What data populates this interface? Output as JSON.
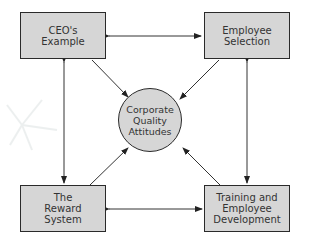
{
  "diagram": {
    "center": {
      "label": "Corporate\nQuality\nAttitudes"
    },
    "nodes": [
      {
        "id": "ceo",
        "label": "CEO's\nExample"
      },
      {
        "id": "selection",
        "label": "Employee\nSelection"
      },
      {
        "id": "reward",
        "label": "The\nReward\nSystem"
      },
      {
        "id": "training",
        "label": "Training and\nEmployee\nDevelopment"
      }
    ],
    "edges": [
      {
        "from": "ceo",
        "to": "selection",
        "type": "bidirectional"
      },
      {
        "from": "reward",
        "to": "training",
        "type": "bidirectional"
      },
      {
        "from": "ceo",
        "to": "reward",
        "type": "bidirectional"
      },
      {
        "from": "selection",
        "to": "training",
        "type": "bidirectional"
      },
      {
        "from": "ceo",
        "to": "center",
        "type": "directed"
      },
      {
        "from": "selection",
        "to": "center",
        "type": "directed"
      },
      {
        "from": "reward",
        "to": "center",
        "type": "directed"
      },
      {
        "from": "training",
        "to": "center",
        "type": "directed"
      }
    ],
    "colors": {
      "fill": "#d6d6d6",
      "stroke": "#2a2a2a"
    }
  }
}
